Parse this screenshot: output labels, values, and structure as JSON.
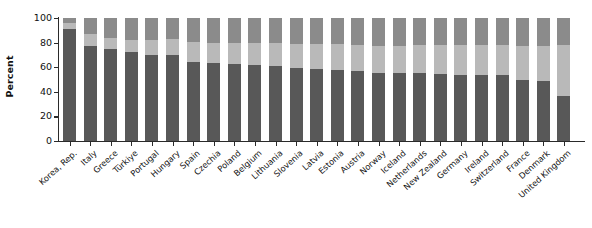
{
  "chart_data": {
    "type": "bar",
    "stacked": true,
    "title": "",
    "xlabel": "",
    "ylabel": "Percent",
    "ylim": [
      0,
      100
    ],
    "yticks": [
      0,
      20,
      40,
      60,
      80,
      100
    ],
    "grid": false,
    "legend": "none",
    "categories": [
      "Korea, Rep.",
      "Italy",
      "Greece",
      "Türkiye",
      "Portugal",
      "Hungary",
      "Spain",
      "Czechia",
      "Poland",
      "Belgium",
      "Lithuania",
      "Slovenia",
      "Latvia",
      "Estonia",
      "Austria",
      "Norway",
      "Iceland",
      "Netherlands",
      "New Zealand",
      "Germany",
      "Ireland",
      "Switzerland",
      "France",
      "Denmark",
      "United Kingdom"
    ],
    "series": [
      {
        "name": "segment-bottom",
        "color": "#585858",
        "values": [
          91,
          77,
          75,
          72,
          70,
          70,
          64.5,
          63.5,
          62.5,
          61.5,
          61,
          59.5,
          58.5,
          58,
          57,
          55.5,
          55,
          55,
          54.5,
          54,
          53.5,
          53.5,
          50,
          48.5,
          37
        ]
      },
      {
        "name": "segment-middle",
        "color": "#b9b9b9",
        "values": [
          5,
          10,
          9,
          10,
          12,
          13,
          16,
          16.5,
          17.5,
          18,
          18.5,
          19.5,
          20,
          20.5,
          21,
          22,
          22.5,
          23,
          23.5,
          24,
          24.5,
          24.5,
          27.5,
          29,
          41
        ]
      },
      {
        "name": "segment-top",
        "color": "#8b8b8b",
        "values": [
          4,
          13,
          16,
          18,
          18,
          17,
          19.5,
          20,
          20,
          20.5,
          20.5,
          21,
          21.5,
          21.5,
          22,
          22.5,
          22.5,
          22,
          22,
          22,
          22,
          22,
          22.5,
          22.5,
          22
        ]
      }
    ]
  },
  "axis": {
    "y_label": "Percent",
    "y_tick_labels": [
      "100",
      "80",
      "60",
      "40",
      "20",
      "0"
    ]
  }
}
